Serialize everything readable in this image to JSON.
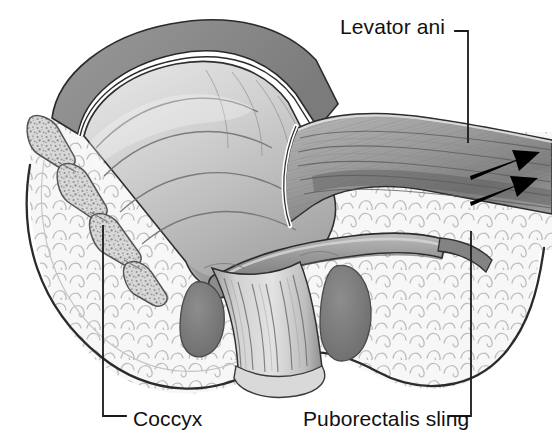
{
  "figure": {
    "type": "medical-anatomical-illustration",
    "style": "grayscale line-and-tone drawing",
    "background_color": "#ffffff",
    "width": 552,
    "height": 447
  },
  "labels": {
    "levator_ani": "Levator ani",
    "coccyx": "Coccyx",
    "puborectalis_sling": "Puborectalis sling"
  },
  "leaders": {
    "levator_ani": {
      "description": "elbow leader: short horizontal run right of text, then vertical drop into muscle belly",
      "color": "#1a1a1a"
    },
    "coccyx": {
      "description": "vertical line from coccyx segment down, elbow turning right to text",
      "color": "#1a1a1a"
    },
    "puborectalis_sling": {
      "description": "vertical line from ischioanal fat down, elbow turning left to text",
      "color": "#1a1a1a"
    }
  },
  "arrows": {
    "count": 2,
    "direction": "pointing right and slightly upward",
    "color": "#000000",
    "meaning": "direction of levator ani muscle pull"
  },
  "structures": [
    {
      "name": "rectum-lumen-mucosa",
      "tone": "#c9c9c9",
      "note": "rounded mucosal folds with gradient shading"
    },
    {
      "name": "rectal-muscularis-wall",
      "tone": "#8e8e8e",
      "note": "gray band with white highlight line"
    },
    {
      "name": "levator-ani-muscle",
      "tone": "#9a9a9a",
      "note": "striated fibers fanning to the right"
    },
    {
      "name": "puborectalis-sling",
      "tone": "#8a8a8a",
      "note": "thick tubular band crossing obliquely"
    },
    {
      "name": "anal-canal",
      "tone": "#b5b5b5",
      "note": "vertical longitudinal columns"
    },
    {
      "name": "external-anal-sphincter",
      "tone": "#7d7d7d",
      "note": "dark gray muscle masses flanking the canal"
    },
    {
      "name": "coccyx-bone",
      "tone": "#b0b0b0",
      "note": "segmented vertebrae with stippled trabecular texture"
    },
    {
      "name": "ischioanal-fat",
      "tone": "#f4f4f4",
      "note": "pale field of small scalloped arc shapes"
    },
    {
      "name": "body-contour",
      "tone": "#333333",
      "note": "smooth dark outline of perineal surface"
    }
  ],
  "colors": {
    "ink": "#1a1a1a",
    "text": "#111111",
    "fat_fill": "#f6f6f6",
    "fat_line": "#b9b9b9",
    "muscle_mid": "#9a9a9a",
    "muscle_dark": "#6f6f6f",
    "mucosa": "#c9c9c9",
    "bone_fill": "#c2c2c2",
    "white": "#ffffff"
  }
}
